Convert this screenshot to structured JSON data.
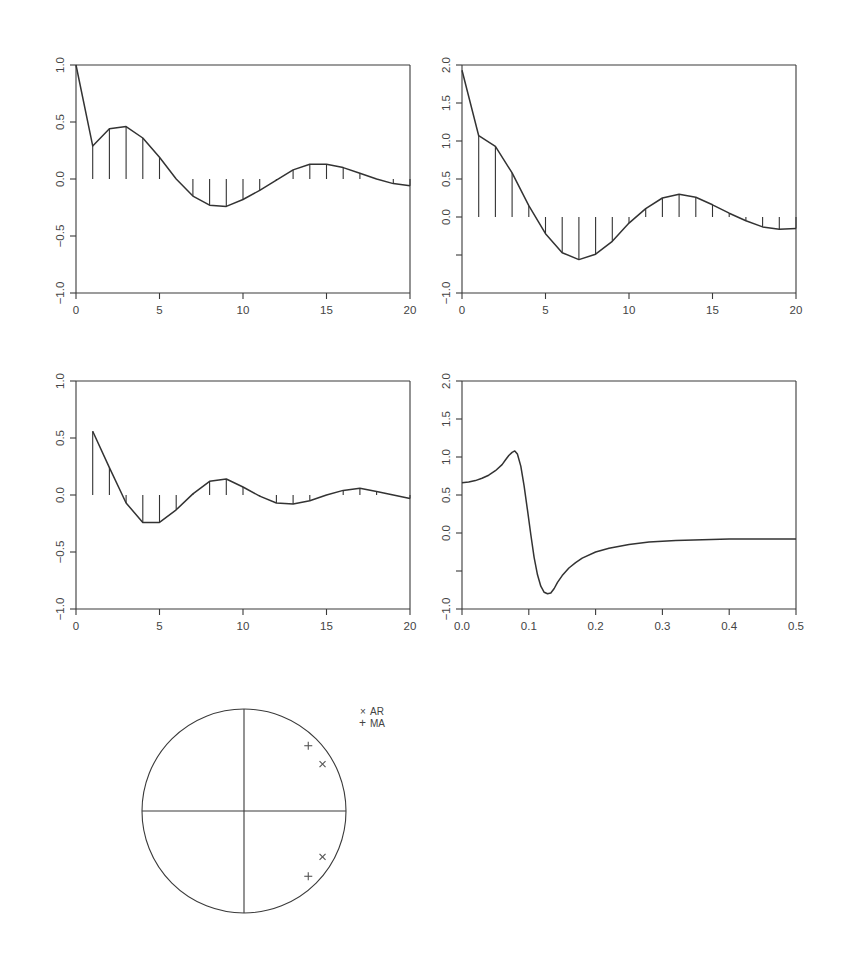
{
  "figure": {
    "panels": 5,
    "line_color": "#333333",
    "background": "#ffffff"
  },
  "chart_data": [
    {
      "id": "acf",
      "type": "line",
      "overlay": "spikes",
      "title": "",
      "xlabel": "",
      "ylabel": "",
      "xlim": [
        0,
        20
      ],
      "ylim": [
        -1.0,
        1.0
      ],
      "xticks": [
        0,
        5,
        10,
        15,
        20
      ],
      "xtick_labels": [
        "0",
        "5",
        "10",
        "15",
        "20"
      ],
      "yticks": [
        -1.0,
        -0.5,
        0.0,
        0.5,
        1.0
      ],
      "ytick_labels": [
        "-1.0",
        "-0.5",
        "0.0",
        "0.5",
        "1.0"
      ],
      "grid": false,
      "x": [
        0,
        1,
        2,
        3,
        4,
        5,
        6,
        7,
        8,
        9,
        10,
        11,
        12,
        13,
        14,
        15,
        16,
        17,
        18,
        19,
        20
      ],
      "values": [
        1.0,
        0.29,
        0.44,
        0.46,
        0.36,
        0.19,
        0.0,
        -0.15,
        -0.23,
        -0.24,
        -0.18,
        -0.1,
        -0.01,
        0.08,
        0.13,
        0.13,
        0.1,
        0.05,
        0.0,
        -0.04,
        -0.06
      ],
      "spikes_from": 1
    },
    {
      "id": "autocovariance",
      "type": "line",
      "overlay": "spikes",
      "title": "",
      "xlabel": "",
      "ylabel": "",
      "xlim": [
        0,
        20
      ],
      "ylim": [
        -1.0,
        2.0
      ],
      "xticks": [
        0,
        5,
        10,
        15,
        20
      ],
      "xtick_labels": [
        "0",
        "5",
        "10",
        "15",
        "20"
      ],
      "yticks": [
        -1.0,
        -0.5,
        0.0,
        0.5,
        1.0,
        1.5,
        2.0
      ],
      "ytick_labels": [
        "-1.0",
        "",
        "0.0",
        "0.5",
        "1.0",
        "1.5",
        "2.0"
      ],
      "grid": false,
      "x": [
        0,
        1,
        2,
        3,
        4,
        5,
        6,
        7,
        8,
        9,
        10,
        11,
        12,
        13,
        14,
        15,
        16,
        17,
        18,
        19,
        20
      ],
      "values": [
        1.93,
        1.07,
        0.93,
        0.58,
        0.15,
        -0.22,
        -0.47,
        -0.56,
        -0.49,
        -0.32,
        -0.08,
        0.11,
        0.25,
        0.3,
        0.26,
        0.16,
        0.05,
        -0.05,
        -0.13,
        -0.16,
        -0.15
      ],
      "spikes_from": 1
    },
    {
      "id": "pacf",
      "type": "line",
      "overlay": "spikes",
      "title": "",
      "xlabel": "",
      "ylabel": "",
      "xlim": [
        0,
        20
      ],
      "ylim": [
        -1.0,
        1.0
      ],
      "xticks": [
        0,
        5,
        10,
        15,
        20
      ],
      "xtick_labels": [
        "0",
        "5",
        "10",
        "15",
        "20"
      ],
      "yticks": [
        -1.0,
        -0.5,
        0.0,
        0.5,
        1.0
      ],
      "ytick_labels": [
        "-1.0",
        "-0.5",
        "0.0",
        "0.5",
        "1.0"
      ],
      "grid": false,
      "x": [
        1,
        2,
        3,
        4,
        5,
        6,
        7,
        8,
        9,
        10,
        11,
        12,
        13,
        14,
        15,
        16,
        17,
        18,
        19,
        20
      ],
      "values": [
        0.56,
        0.24,
        -0.07,
        -0.24,
        -0.24,
        -0.13,
        0.01,
        0.12,
        0.14,
        0.07,
        -0.01,
        -0.07,
        -0.08,
        -0.05,
        0.0,
        0.04,
        0.06,
        0.03,
        0.0,
        -0.03
      ],
      "spikes_from": 1
    },
    {
      "id": "spectrum",
      "type": "line",
      "title": "",
      "xlabel": "",
      "ylabel": "",
      "xlim": [
        0.0,
        0.5
      ],
      "ylim": [
        -1.0,
        2.0
      ],
      "xticks": [
        0.0,
        0.1,
        0.2,
        0.3,
        0.4,
        0.5
      ],
      "xtick_labels": [
        "0.0",
        "0.1",
        "0.2",
        "0.3",
        "0.4",
        "0.5"
      ],
      "yticks": [
        -1.0,
        -0.5,
        0.0,
        0.5,
        1.0,
        1.5,
        2.0
      ],
      "ytick_labels": [
        "-1.0",
        "",
        "0.0",
        "0.5",
        "1.0",
        "1.5",
        "2.0"
      ],
      "grid": false,
      "x": [
        0.0,
        0.01,
        0.02,
        0.03,
        0.04,
        0.05,
        0.06,
        0.065,
        0.07,
        0.075,
        0.079,
        0.083,
        0.088,
        0.093,
        0.098,
        0.103,
        0.108,
        0.113,
        0.118,
        0.123,
        0.128,
        0.133,
        0.138,
        0.143,
        0.15,
        0.16,
        0.17,
        0.18,
        0.2,
        0.22,
        0.25,
        0.28,
        0.32,
        0.36,
        0.4,
        0.45,
        0.5
      ],
      "values": [
        0.66,
        0.67,
        0.69,
        0.72,
        0.76,
        0.82,
        0.9,
        0.96,
        1.02,
        1.06,
        1.08,
        1.04,
        0.88,
        0.62,
        0.3,
        -0.02,
        -0.32,
        -0.55,
        -0.7,
        -0.78,
        -0.8,
        -0.79,
        -0.73,
        -0.65,
        -0.56,
        -0.46,
        -0.39,
        -0.33,
        -0.25,
        -0.2,
        -0.15,
        -0.12,
        -0.1,
        -0.09,
        -0.08,
        -0.08,
        -0.08
      ]
    },
    {
      "id": "roots",
      "type": "scatter",
      "title": "",
      "shape": "unit-circle",
      "legend": [
        {
          "symbol": "×",
          "label": "AR"
        },
        {
          "symbol": "+",
          "label": "MA"
        }
      ],
      "legend_position": "top-right",
      "series": [
        {
          "name": "AR",
          "symbol": "x",
          "points": [
            [
              0.77,
              0.46
            ],
            [
              0.77,
              -0.45
            ]
          ]
        },
        {
          "name": "MA",
          "symbol": "+",
          "points": [
            [
              0.63,
              0.64
            ],
            [
              0.63,
              -0.64
            ]
          ]
        }
      ]
    }
  ]
}
